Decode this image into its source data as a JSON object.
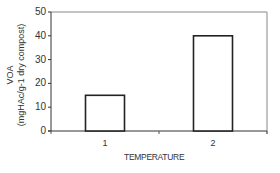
{
  "chart_data": {
    "type": "bar",
    "title": "",
    "categories": [
      "1",
      "2"
    ],
    "values": [
      15,
      40
    ],
    "xlabel": "TEMPERATURE",
    "ylabel": "VOA (mgHAc/g-1 dry compost)",
    "ylabel_lines": [
      "VOA",
      "(mgHAc/g-1 dry compost)"
    ],
    "ylim": [
      0,
      50
    ],
    "yticks": [
      0,
      10,
      20,
      30,
      40,
      50
    ],
    "grid": false,
    "legend": null,
    "bar_fill": "#ffffff",
    "bar_stroke": "#222222"
  }
}
